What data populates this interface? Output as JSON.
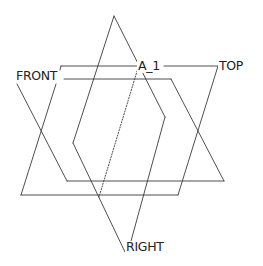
{
  "diagram": {
    "type": "datum-planes-3d",
    "colors": {
      "stroke": "#3a3a3a",
      "text": "#222222",
      "background": "#ffffff"
    },
    "labels": {
      "front": "FRONT",
      "top": "TOP",
      "right": "RIGHT",
      "axis": "A_1"
    },
    "planes": [
      {
        "name": "TOP",
        "points": [
          [
            61,
            66
          ],
          [
            218,
            66
          ],
          [
            178,
            195
          ],
          [
            21,
            195
          ],
          [
            56,
            84
          ]
        ]
      },
      {
        "name": "FRONT",
        "points": [
          [
            64,
            79
          ],
          [
            171,
            79
          ],
          [
            224,
            181
          ],
          [
            67,
            181
          ],
          [
            17,
            84
          ]
        ]
      },
      {
        "name": "RIGHT",
        "points": [
          [
            128,
            252
          ],
          [
            165,
            117
          ],
          [
            114,
            16
          ],
          [
            73,
            143
          ],
          [
            125,
            252
          ]
        ]
      }
    ],
    "axis": {
      "name": "A_1",
      "from": [
        138,
        66
      ],
      "to": [
        99,
        197
      ],
      "style": "dotted"
    }
  }
}
